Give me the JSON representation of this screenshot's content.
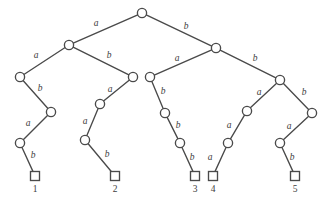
{
  "figure": {
    "kind": "binary-code-tree",
    "background_color": "#ffffff",
    "stroke_color": "#4a4a4a",
    "text_color": "#3d3d3d",
    "width": 331,
    "height": 205
  },
  "nodes": [
    {
      "id": "root",
      "shape": "circle",
      "x": 142,
      "y": 13,
      "r": 4.6
    },
    {
      "id": "L",
      "shape": "circle",
      "x": 69,
      "y": 45,
      "r": 4.6
    },
    {
      "id": "R",
      "shape": "circle",
      "x": 216,
      "y": 48,
      "r": 4.6
    },
    {
      "id": "LA",
      "shape": "circle",
      "x": 20,
      "y": 77,
      "r": 4.6
    },
    {
      "id": "LB",
      "shape": "circle",
      "x": 133,
      "y": 77,
      "r": 4.6
    },
    {
      "id": "RA",
      "shape": "circle",
      "x": 150,
      "y": 77,
      "r": 4.6
    },
    {
      "id": "RB",
      "shape": "circle",
      "x": 280,
      "y": 80,
      "r": 4.6
    },
    {
      "id": "LAB",
      "shape": "circle",
      "x": 51,
      "y": 112,
      "r": 4.6
    },
    {
      "id": "LBA",
      "shape": "circle",
      "x": 100,
      "y": 104,
      "r": 4.6
    },
    {
      "id": "RAB",
      "shape": "circle",
      "x": 165,
      "y": 113,
      "r": 4.6
    },
    {
      "id": "RBA",
      "shape": "circle",
      "x": 247,
      "y": 111,
      "r": 4.6
    },
    {
      "id": "RBB",
      "shape": "circle",
      "x": 312,
      "y": 113,
      "r": 4.6
    },
    {
      "id": "LABA",
      "shape": "circle",
      "x": 20,
      "y": 143,
      "r": 4.6
    },
    {
      "id": "LBAA",
      "shape": "circle",
      "x": 85,
      "y": 140,
      "r": 4.6
    },
    {
      "id": "RABB",
      "shape": "circle",
      "x": 180,
      "y": 143,
      "r": 4.6
    },
    {
      "id": "RBAA",
      "shape": "circle",
      "x": 228,
      "y": 143,
      "r": 4.6
    },
    {
      "id": "RBBA",
      "shape": "circle",
      "x": 280,
      "y": 143,
      "r": 4.6
    },
    {
      "id": "leaf1",
      "shape": "square",
      "x": 35,
      "y": 176,
      "size": 9
    },
    {
      "id": "leaf2",
      "shape": "square",
      "x": 115,
      "y": 176,
      "size": 9
    },
    {
      "id": "leaf3",
      "shape": "square",
      "x": 195,
      "y": 176,
      "size": 9
    },
    {
      "id": "leaf4",
      "shape": "square",
      "x": 213,
      "y": 176,
      "size": 9
    },
    {
      "id": "leaf5",
      "shape": "square",
      "x": 295,
      "y": 176,
      "size": 9
    }
  ],
  "edges": [
    {
      "from": "root",
      "to": "L",
      "label": "a",
      "lx": 96,
      "ly": 24
    },
    {
      "from": "root",
      "to": "R",
      "label": "b",
      "lx": 186,
      "ly": 27
    },
    {
      "from": "L",
      "to": "LA",
      "label": "a",
      "lx": 36,
      "ly": 56
    },
    {
      "from": "L",
      "to": "LB",
      "label": "b",
      "lx": 109,
      "ly": 56
    },
    {
      "from": "R",
      "to": "RA",
      "label": "a",
      "lx": 177,
      "ly": 59
    },
    {
      "from": "R",
      "to": "RB",
      "label": "b",
      "lx": 255,
      "ly": 59
    },
    {
      "from": "LA",
      "to": "LAB",
      "label": "b",
      "lx": 40,
      "ly": 89
    },
    {
      "from": "LB",
      "to": "LBA",
      "label": "a",
      "lx": 110,
      "ly": 90
    },
    {
      "from": "RA",
      "to": "RAB",
      "label": "b",
      "lx": 163,
      "ly": 92
    },
    {
      "from": "RB",
      "to": "RBA",
      "label": "a",
      "lx": 259,
      "ly": 93
    },
    {
      "from": "RB",
      "to": "RBB",
      "label": "b",
      "lx": 304,
      "ly": 93
    },
    {
      "from": "LAB",
      "to": "LABA",
      "label": "a",
      "lx": 28,
      "ly": 124
    },
    {
      "from": "LBA",
      "to": "LBAA",
      "label": "a",
      "lx": 85,
      "ly": 122
    },
    {
      "from": "RAB",
      "to": "RABB",
      "label": "b",
      "lx": 178,
      "ly": 126
    },
    {
      "from": "RBA",
      "to": "RBAA",
      "label": "a",
      "lx": 229,
      "ly": 126
    },
    {
      "from": "RBB",
      "to": "RBBA",
      "label": "a",
      "lx": 289,
      "ly": 127
    },
    {
      "from": "LABA",
      "to": "leaf1",
      "label": "b",
      "lx": 33,
      "ly": 156
    },
    {
      "from": "LBAA",
      "to": "leaf2",
      "label": "b",
      "lx": 107,
      "ly": 155
    },
    {
      "from": "RABB",
      "to": "leaf3",
      "label": "b",
      "lx": 192,
      "ly": 158
    },
    {
      "from": "RBAA",
      "to": "leaf4",
      "label": "a",
      "lx": 210,
      "ly": 158
    },
    {
      "from": "RBBA",
      "to": "leaf5",
      "label": "b",
      "lx": 292,
      "ly": 158
    }
  ],
  "leaf_labels": [
    {
      "for": "leaf1",
      "text": "1",
      "x": 35,
      "y": 185
    },
    {
      "for": "leaf2",
      "text": "2",
      "x": 115,
      "y": 185
    },
    {
      "for": "leaf3",
      "text": "3",
      "x": 195,
      "y": 185
    },
    {
      "for": "leaf4",
      "text": "4",
      "x": 213,
      "y": 185
    },
    {
      "for": "leaf5",
      "text": "5",
      "x": 295,
      "y": 185
    }
  ]
}
